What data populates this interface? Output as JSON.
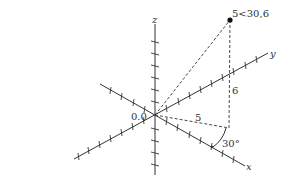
{
  "diagram": {
    "type": "3d-coordinate-system",
    "axes": {
      "x_label": "x",
      "y_label": "y",
      "z_label": "z"
    },
    "origin_label": "0.0",
    "point": {
      "label": "5<30,6",
      "r": 5,
      "theta_deg": 30,
      "z": 6
    },
    "annotations": {
      "radius_label": "5",
      "height_label": "6",
      "angle_label": "30°"
    },
    "colors": {
      "axis": "#333333",
      "dashed": "#333333",
      "point": "#111111"
    }
  }
}
